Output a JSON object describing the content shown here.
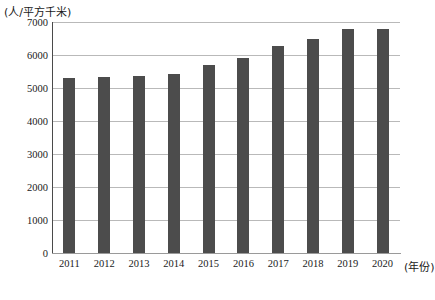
{
  "chart_data": {
    "type": "bar",
    "title": "",
    "subtitle": "",
    "xlabel": "(年份)",
    "ylabel": "(人/平方千米)",
    "categories": [
      "2011",
      "2012",
      "2013",
      "2014",
      "2015",
      "2016",
      "2017",
      "2018",
      "2019",
      "2020"
    ],
    "values": [
      5300,
      5320,
      5350,
      5430,
      5700,
      5920,
      6280,
      6480,
      6800,
      6780
    ],
    "series": [
      {
        "name": "人口密度",
        "values": [
          5300,
          5320,
          5350,
          5430,
          5700,
          5920,
          6280,
          6480,
          6800,
          6780
        ]
      }
    ],
    "ylim": [
      0,
      7000
    ],
    "yticks": [
      0,
      1000,
      2000,
      3000,
      4000,
      5000,
      6000,
      7000
    ],
    "ytick_labels": [
      "0",
      "1000",
      "2000",
      "3000",
      "4000",
      "5000",
      "6000",
      "7000"
    ],
    "grid": true,
    "grid_axis": "y",
    "legend": false,
    "legend_position": "none",
    "bar_color": "#4c4c4c",
    "grid_color": "#b9b9b9",
    "axis_color": "#4a4a4a",
    "background": "#ffffff"
  }
}
